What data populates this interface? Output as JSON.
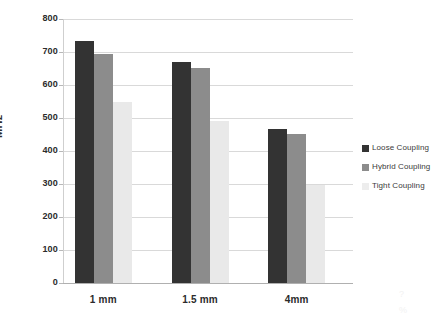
{
  "chart_data": {
    "type": "bar",
    "title": "",
    "subtitle": "",
    "xlabel": "",
    "ylabel": "MHz",
    "categories": [
      "1 mm",
      "1.5 mm",
      "4mm"
    ],
    "ylim": [
      0,
      800
    ],
    "ytick_labels": [
      "0",
      "100",
      "200",
      "300",
      "400",
      "500",
      "600",
      "700",
      "800"
    ],
    "ytick_values": [
      0,
      100,
      200,
      300,
      400,
      500,
      600,
      700,
      800
    ],
    "grid": true,
    "legend_position": "right",
    "series": [
      {
        "name": "Loose Coupling",
        "color": "#333333",
        "values": [
          732,
          670,
          467
        ]
      },
      {
        "name": "Hybrid Coupling",
        "color": "#8c8c8c",
        "values": [
          695,
          652,
          452
        ]
      },
      {
        "name": "Tight Coupling",
        "color": "#e9e9e9",
        "values": [
          550,
          492,
          298
        ]
      }
    ]
  },
  "legend": {
    "items": [
      {
        "label": "Loose Coupling",
        "swatch": "#333333"
      },
      {
        "label": "Hybrid Coupling",
        "swatch": "#8c8c8c"
      },
      {
        "label": "Tight Coupling",
        "swatch": "#ededed"
      }
    ]
  },
  "artifacts": {
    "mark1": "?",
    "mark2": "%"
  }
}
